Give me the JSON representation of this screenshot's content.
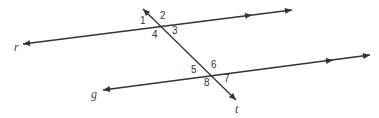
{
  "diagram": {
    "type": "parallel-lines-cut-by-transversal",
    "line_color": "#333333",
    "lines": [
      {
        "name": "r",
        "label": "r",
        "x1": 23,
        "y1": 44,
        "x2": 292,
        "y2": 10,
        "mid_arrow": [
          252,
          15
        ],
        "label_pos": [
          14,
          51
        ]
      },
      {
        "name": "g",
        "label": "g",
        "x1": 103,
        "y1": 90,
        "x2": 370,
        "y2": 55,
        "mid_arrow": [
          333,
          60
        ],
        "label_pos": [
          91,
          98
        ]
      },
      {
        "name": "t",
        "label": "t",
        "x1": 143,
        "y1": 9,
        "x2": 236,
        "y2": 100,
        "label_pos": [
          235,
          113
        ]
      }
    ],
    "angles": [
      {
        "label": "1",
        "x": 140,
        "y": 24
      },
      {
        "label": "2",
        "x": 160,
        "y": 19
      },
      {
        "label": "3",
        "x": 172,
        "y": 34
      },
      {
        "label": "4",
        "x": 152,
        "y": 38
      },
      {
        "label": "5",
        "x": 191,
        "y": 73
      },
      {
        "label": "6",
        "x": 211,
        "y": 68
      },
      {
        "label": "7",
        "x": 224,
        "y": 82
      },
      {
        "label": "8",
        "x": 204,
        "y": 86
      }
    ]
  }
}
